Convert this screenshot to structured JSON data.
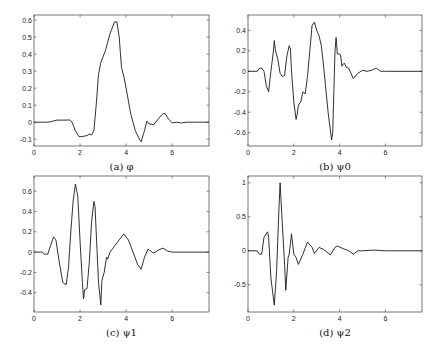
{
  "chart_data": [
    {
      "id": "a",
      "type": "line",
      "caption": "(a) φ",
      "box": {
        "left": 34,
        "top": 15,
        "right": 209,
        "bottom": 146
      },
      "xlim": [
        0,
        7.6
      ],
      "ylim": [
        -0.14,
        0.63
      ],
      "xticks": [
        0,
        2,
        4,
        6
      ],
      "yticks": [
        -0.1,
        0,
        0.1,
        0.2,
        0.3,
        0.4,
        0.5,
        0.6
      ],
      "ytick_labels": [
        "-0.1",
        "0",
        "0.1",
        "0.2",
        "0.3",
        "0.4",
        "0.5",
        "0.6"
      ],
      "x": [
        0,
        0.6,
        0.8,
        1.0,
        1.3,
        1.55,
        1.65,
        1.8,
        1.95,
        2.1,
        2.3,
        2.4,
        2.5,
        2.6,
        2.7,
        2.8,
        2.9,
        3.1,
        3.3,
        3.5,
        3.6,
        3.7,
        3.8,
        3.9,
        4.0,
        4.2,
        4.4,
        4.6,
        4.65,
        4.8,
        4.9,
        4.95,
        5.0,
        5.2,
        5.4,
        5.6,
        5.7,
        5.8,
        6.0,
        6.2,
        6.4,
        6.6,
        7.6
      ],
      "y": [
        0,
        0,
        0.005,
        0.012,
        0.012,
        0.013,
        0.0,
        -0.05,
        -0.085,
        -0.085,
        -0.078,
        -0.07,
        -0.075,
        -0.05,
        0.1,
        0.28,
        0.35,
        0.42,
        0.52,
        0.59,
        0.59,
        0.5,
        0.32,
        0.27,
        0.2,
        0.05,
        -0.05,
        -0.105,
        -0.115,
        -0.05,
        0.005,
        0.0,
        -0.01,
        -0.015,
        0.02,
        0.05,
        0.05,
        0.025,
        -0.005,
        0.0,
        -0.005,
        0.0,
        0.0
      ]
    },
    {
      "id": "b",
      "type": "line",
      "caption": "(b) ψ0",
      "box": {
        "left": 248,
        "top": 15,
        "right": 422,
        "bottom": 146
      },
      "xlim": [
        0,
        7.6
      ],
      "ylim": [
        -0.73,
        0.55
      ],
      "xticks": [
        0,
        2,
        4,
        6
      ],
      "yticks": [
        -0.6,
        -0.4,
        -0.2,
        0,
        0.2,
        0.4
      ],
      "ytick_labels": [
        "-0.6",
        "-0.4",
        "-0.2",
        "0",
        "0.2",
        "0.4"
      ],
      "x": [
        0,
        0.4,
        0.5,
        0.6,
        0.7,
        0.8,
        0.9,
        1.0,
        1.1,
        1.15,
        1.2,
        1.3,
        1.4,
        1.5,
        1.6,
        1.7,
        1.8,
        1.85,
        1.9,
        2.0,
        2.1,
        2.15,
        2.2,
        2.3,
        2.4,
        2.5,
        2.6,
        2.7,
        2.8,
        2.9,
        3.0,
        3.1,
        3.2,
        3.3,
        3.5,
        3.65,
        3.7,
        3.8,
        3.85,
        3.9,
        4.0,
        4.05,
        4.1,
        4.2,
        4.3,
        4.4,
        4.6,
        4.8,
        5.0,
        5.2,
        5.4,
        5.6,
        5.8,
        6.0,
        7.6
      ],
      "y": [
        0,
        0,
        0.03,
        0.03,
        0.0,
        -0.14,
        -0.2,
        0.0,
        0.18,
        0.3,
        0.2,
        0.12,
        -0.02,
        -0.05,
        -0.04,
        0.15,
        0.25,
        0.22,
        0.0,
        -0.3,
        -0.47,
        -0.42,
        -0.33,
        -0.3,
        -0.2,
        -0.22,
        -0.05,
        0.2,
        0.45,
        0.48,
        0.4,
        0.35,
        0.25,
        0.05,
        -0.4,
        -0.67,
        -0.6,
        0.2,
        0.33,
        0.17,
        0.17,
        0.15,
        0.05,
        0.08,
        0.04,
        0.03,
        -0.07,
        -0.02,
        0.01,
        0.0,
        0.01,
        0.03,
        0.0,
        0.0,
        0.0
      ]
    },
    {
      "id": "c",
      "type": "line",
      "caption": "(c) ψ1",
      "box": {
        "left": 34,
        "top": 176,
        "right": 209,
        "bottom": 312
      },
      "xlim": [
        0,
        7.6
      ],
      "ylim": [
        -0.59,
        0.75
      ],
      "xticks": [
        0,
        2,
        4,
        6
      ],
      "yticks": [
        -0.4,
        -0.2,
        0,
        0.2,
        0.4,
        0.6
      ],
      "ytick_labels": [
        "-0.4",
        "-0.2",
        "0",
        "0.2",
        "0.4",
        "0.6"
      ],
      "x": [
        0,
        0.35,
        0.45,
        0.6,
        0.7,
        0.85,
        0.95,
        1.1,
        1.25,
        1.4,
        1.5,
        1.6,
        1.7,
        1.8,
        1.9,
        2.0,
        2.1,
        2.15,
        2.2,
        2.3,
        2.4,
        2.5,
        2.6,
        2.65,
        2.7,
        2.8,
        2.9,
        2.95,
        3.05,
        3.15,
        3.2,
        3.3,
        3.5,
        3.7,
        3.9,
        4.1,
        4.3,
        4.5,
        4.65,
        4.8,
        4.95,
        5.0,
        5.2,
        5.4,
        5.6,
        5.8,
        6.0,
        7.6
      ],
      "y": [
        0,
        0,
        -0.02,
        -0.02,
        0.05,
        0.15,
        0.12,
        -0.1,
        -0.3,
        -0.32,
        -0.15,
        0.2,
        0.5,
        0.67,
        0.55,
        0.1,
        -0.3,
        -0.46,
        -0.37,
        -0.36,
        -0.1,
        0.3,
        0.5,
        0.45,
        0.2,
        -0.3,
        -0.52,
        -0.28,
        -0.2,
        -0.05,
        -0.07,
        0.0,
        0.06,
        0.12,
        0.18,
        0.12,
        0.0,
        -0.12,
        -0.17,
        -0.05,
        0.03,
        0.02,
        -0.01,
        0.02,
        0.04,
        0.01,
        0.0,
        0.0
      ]
    },
    {
      "id": "d",
      "type": "line",
      "caption": "(d) ψ2",
      "box": {
        "left": 248,
        "top": 176,
        "right": 422,
        "bottom": 312
      },
      "xlim": [
        0,
        7.6
      ],
      "ylim": [
        -0.9,
        1.1
      ],
      "xticks": [
        0,
        2,
        4,
        6
      ],
      "yticks": [
        -0.5,
        0,
        0.5,
        1
      ],
      "ytick_labels": [
        "-0.5",
        "0",
        "0.5",
        "1"
      ],
      "x": [
        0,
        0.4,
        0.5,
        0.6,
        0.7,
        0.8,
        0.85,
        0.9,
        1.0,
        1.15,
        1.25,
        1.35,
        1.4,
        1.5,
        1.6,
        1.65,
        1.75,
        1.8,
        1.9,
        2.0,
        2.1,
        2.2,
        2.4,
        2.6,
        2.8,
        2.9,
        3.1,
        3.3,
        3.6,
        3.8,
        3.9,
        4.1,
        4.4,
        4.6,
        4.8,
        5.0,
        5.5,
        6.0,
        7.6
      ],
      "y": [
        0,
        0,
        -0.05,
        -0.05,
        0.2,
        0.25,
        0.28,
        0.2,
        -0.4,
        -0.8,
        -0.3,
        0.6,
        1.0,
        0.4,
        -0.2,
        -0.58,
        -0.1,
        -0.05,
        0.25,
        -0.05,
        -0.1,
        -0.2,
        -0.05,
        0.13,
        0.05,
        -0.04,
        0.05,
        0.02,
        -0.06,
        0.05,
        0.07,
        0.04,
        0.0,
        -0.05,
        0.0,
        0.0,
        0.01,
        0.0,
        0.0
      ]
    }
  ]
}
